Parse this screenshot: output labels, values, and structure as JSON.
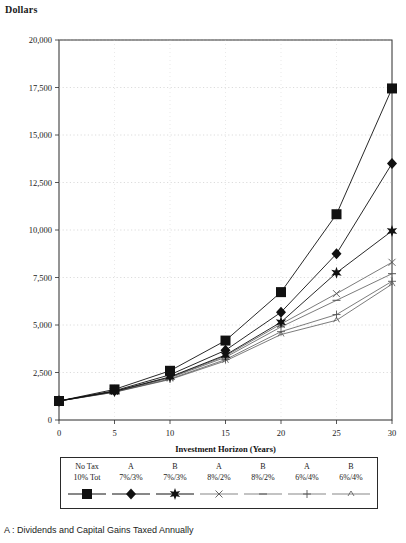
{
  "figure": {
    "y_axis_title": "Dollars",
    "x_axis_title": "Investment Horizon (Years)",
    "caption": "A : Dividends and Capital Gains Taxed Annually"
  },
  "legend": {
    "columns": [
      {
        "line1": "No Tax",
        "line2": "10% Tot",
        "symbol": "square"
      },
      {
        "line1": "A",
        "line2": "7%/3%",
        "symbol": "diamond"
      },
      {
        "line1": "B",
        "line2": "7%/3%",
        "symbol": "star"
      },
      {
        "line1": "A",
        "line2": "8%/2%",
        "symbol": "cross"
      },
      {
        "line1": "B",
        "line2": "8%/2%",
        "symbol": "dash"
      },
      {
        "line1": "A",
        "line2": "6%/4%",
        "symbol": "plus"
      },
      {
        "line1": "B",
        "line2": "6%/4%",
        "symbol": "tick"
      }
    ]
  },
  "chart_data": {
    "type": "line",
    "title": "",
    "xlabel": "Investment Horizon (Years)",
    "ylabel": "Dollars",
    "x": [
      0,
      5,
      10,
      15,
      20,
      25,
      30
    ],
    "xlim": [
      0,
      30
    ],
    "ylim": [
      0,
      20000
    ],
    "xticks": [
      "0",
      "5",
      "10",
      "15",
      "20",
      "25",
      "30"
    ],
    "yticks": [
      "0",
      "2,500",
      "5,000",
      "7,500",
      "10,000",
      "12,500",
      "15,000",
      "17,500",
      "20,000"
    ],
    "grid": true,
    "legend_position": "bottom",
    "series": [
      {
        "name": "No Tax 10% Tot",
        "marker": "square",
        "values": [
          1000,
          1610,
          2590,
          4180,
          6730,
          10830,
          17450
        ]
      },
      {
        "name": "A 7%/3%",
        "marker": "diamond",
        "values": [
          1000,
          1540,
          2380,
          3670,
          5670,
          8750,
          13500
        ]
      },
      {
        "name": "B 7%/3%",
        "marker": "star",
        "values": [
          1000,
          1510,
          2270,
          3420,
          5150,
          7750,
          9950
        ]
      },
      {
        "name": "A 8%/2%",
        "marker": "cross",
        "values": [
          1000,
          1500,
          2250,
          3370,
          5050,
          6650,
          8300
        ]
      },
      {
        "name": "B 8%/2%",
        "marker": "dash",
        "values": [
          1000,
          1490,
          2220,
          3300,
          4900,
          6300,
          7700
        ]
      },
      {
        "name": "A 6%/4%",
        "marker": "plus",
        "values": [
          1000,
          1470,
          2160,
          3180,
          4650,
          5550,
          7300
        ]
      },
      {
        "name": "B 6%/4%",
        "marker": "tick",
        "values": [
          1000,
          1460,
          2130,
          3110,
          4500,
          5250,
          7150
        ]
      }
    ]
  }
}
